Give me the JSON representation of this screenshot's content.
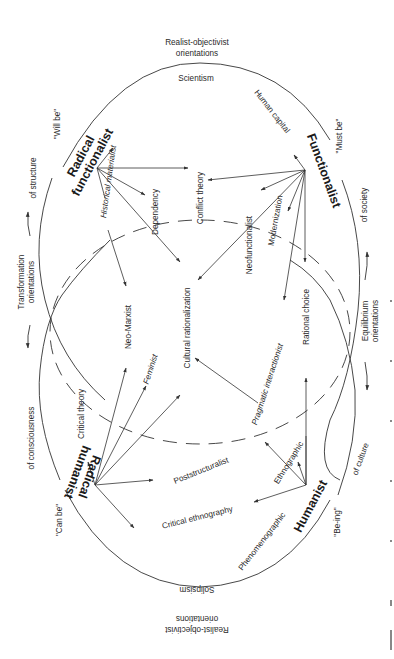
{
  "diagram": {
    "type": "paradigm-map",
    "top_label": {
      "line1": "Realist-objectivist",
      "line2": "orientations"
    },
    "bottom_label": {
      "line1": "Realist-objectivist",
      "line2": "orientations"
    },
    "left_label": {
      "line1": "Transformation",
      "line2": "orientations"
    },
    "right_label": {
      "line1": "Equilibrium",
      "line2": "orientations"
    },
    "poles": {
      "top": "Scientism",
      "bottom": "Solipsism"
    },
    "arc_labels": {
      "of_structure": "of structure",
      "of_consciousness": "of consciousness",
      "of_society": "of society",
      "of_culture": "of culture",
      "will_be": "\"Will be\"",
      "must_be": "\"Must be\"",
      "can_be": "\"Can be\"",
      "be_ing": "\"Be-ing\""
    },
    "paradigms": {
      "radical_functionalist": {
        "line1": "Radical",
        "line2": "functionalist"
      },
      "functionalist": "Functionalist",
      "radical_humanist": {
        "line1": "Radical",
        "line2": "humanist"
      },
      "humanist": "Humanist"
    },
    "theories": {
      "historical_materialist": "Historical materialist",
      "dependency": "Dependency",
      "conflict_theory": "Conflict theory",
      "human_capital": "Human capital",
      "modernization": "Modernization",
      "neofunctionalist": "Neofunctionalist",
      "rational_choice": "Rational choice",
      "cultural_rationalization": "Cultural rationalization",
      "neo_marxist": "Neo-Marxist",
      "feminist": "Feminist",
      "critical_theory": "Critical theory",
      "pragmatic_interactionist": "Pragmatic interactionist",
      "poststructuralist": "Poststructuralist",
      "ethnographic": "Ethnographic",
      "critical_ethnography": "Critical ethnography",
      "phenomenographic": "Phenomenographic"
    },
    "edges": [
      {
        "from": "Radical functionalist",
        "to": "Historical materialist"
      },
      {
        "from": "Radical functionalist",
        "to": "Conflict theory"
      },
      {
        "from": "Radical functionalist",
        "to": "Dependency"
      },
      {
        "from": "Radical functionalist",
        "to": "Cultural rationalization"
      },
      {
        "from": "Radical functionalist",
        "to": "Neo-Marxist"
      },
      {
        "from": "Functionalist",
        "to": "Human capital"
      },
      {
        "from": "Functionalist",
        "to": "Conflict theory"
      },
      {
        "from": "Functionalist",
        "to": "Neofunctionalist"
      },
      {
        "from": "Functionalist",
        "to": "Modernization"
      },
      {
        "from": "Functionalist",
        "to": "Cultural rationalization"
      },
      {
        "from": "Functionalist",
        "to": "Pragmatic interactionist"
      },
      {
        "from": "Functionalist",
        "to": "Rational choice"
      },
      {
        "from": "Radical humanist",
        "to": "Critical theory"
      },
      {
        "from": "Radical humanist",
        "to": "Neo-Marxist"
      },
      {
        "from": "Radical humanist",
        "to": "Feminist"
      },
      {
        "from": "Radical humanist",
        "to": "Cultural rationalization"
      },
      {
        "from": "Radical humanist",
        "to": "Poststructuralist"
      },
      {
        "from": "Radical humanist",
        "to": "Critical ethnography"
      },
      {
        "from": "Humanist",
        "to": "Rational choice"
      },
      {
        "from": "Humanist",
        "to": "Ethnographic"
      },
      {
        "from": "Humanist",
        "to": "Pragmatic interactionist"
      },
      {
        "from": "Humanist",
        "to": "Critical ethnography"
      },
      {
        "from": "Pragmatic interactionist",
        "to": "Cultural rationalization"
      }
    ]
  }
}
